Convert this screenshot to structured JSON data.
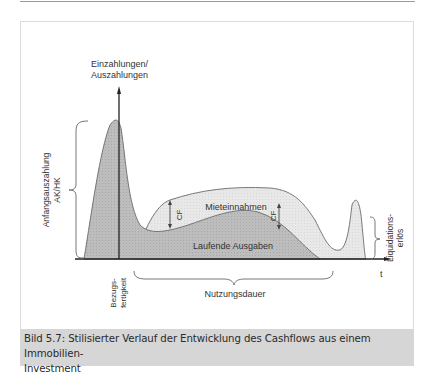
{
  "figure": {
    "y_axis_label_line1": "Einzahlungen/",
    "y_axis_label_line2": "Auszahlungen",
    "x_axis_label": "t",
    "initial_payment_label_line1": "Anfangsauszahlung",
    "initial_payment_label_line2": "AK/HK",
    "rental_income_label": "Mieteinnahmen",
    "running_costs_label": "Laufende Ausgaben",
    "cf_label_1": "CF",
    "cf_label_2": "CF",
    "completion_label_line1": "Bezugs-",
    "completion_label_line2": "fertigkeit",
    "usage_period_label": "Nutzungsdauer",
    "liquidation_label_line1": "Liquidations-",
    "liquidation_label_line2": "erlös"
  },
  "caption": {
    "text_line1": "Bild 5.7: Stilisierter Verlauf der Entwicklung des Cashflows aus einem Immobilien-",
    "text_line2": "Investment"
  },
  "colors": {
    "dark_fill": "#b4b4b4",
    "light_fill": "#e6e6e6",
    "caption_bg": "#d6d6d6"
  }
}
